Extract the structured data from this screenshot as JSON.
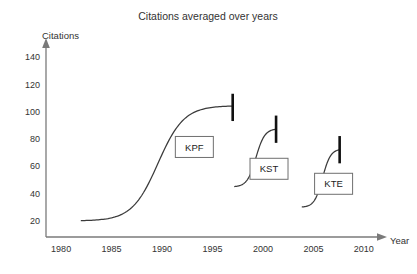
{
  "chart_data": {
    "type": "line",
    "title": "Citations averaged over years",
    "xlabel": "Year",
    "ylabel": "Citations",
    "xlim": [
      1978.5,
      2011.5
    ],
    "ylim": [
      8,
      148
    ],
    "grid": false,
    "legend_position": "inline-boxed-labels",
    "x_ticks": [
      "1980",
      "1985",
      "1990",
      "1995",
      "2000",
      "2005",
      "2010"
    ],
    "x_tick_values": [
      1980,
      1985,
      1990,
      1995,
      2000,
      2005,
      2010
    ],
    "y_ticks": [
      "20",
      "40",
      "60",
      "80",
      "100",
      "120",
      "140"
    ],
    "y_tick_values": [
      20,
      40,
      60,
      80,
      100,
      120,
      140
    ],
    "series": [
      {
        "name": "KPF",
        "shape": "sigmoid",
        "x_start": 1982.0,
        "x_end": 1997.0,
        "y_start": 20,
        "y_end": 104,
        "midpoint_x": 1989.6,
        "steepness": 0.78,
        "errorbar": {
          "x": 1997.0,
          "center": 103,
          "low": 93,
          "high": 113
        },
        "label_box": {
          "text": "KPF",
          "x": 1993.2,
          "y": 74
        }
      },
      {
        "name": "KST",
        "shape": "sigmoid",
        "x_start": 1997.2,
        "x_end": 2001.3,
        "y_start": 45,
        "y_end": 87,
        "midpoint_x": 1999.3,
        "steepness": 2.3,
        "errorbar": {
          "x": 2001.3,
          "center": 87,
          "low": 77,
          "high": 97
        },
        "label_box": {
          "text": "KST",
          "x": 2000.6,
          "y": 58
        }
      },
      {
        "name": "KTE",
        "shape": "sigmoid",
        "x_start": 2003.9,
        "x_end": 2007.6,
        "y_start": 30,
        "y_end": 72,
        "midpoint_x": 2005.9,
        "steepness": 2.5,
        "errorbar": {
          "x": 2007.6,
          "center": 72,
          "low": 62,
          "high": 82
        },
        "label_box": {
          "text": "KTE",
          "x": 2007.0,
          "y": 47
        }
      }
    ]
  }
}
